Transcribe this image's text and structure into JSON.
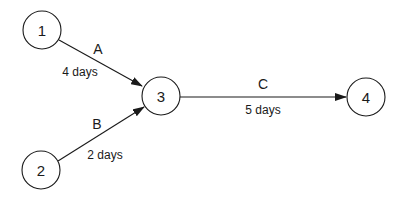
{
  "diagram": {
    "type": "activity-on-arrow network",
    "nodes": [
      {
        "id": "1",
        "label": "1",
        "cx": 42,
        "cy": 30,
        "r": 19
      },
      {
        "id": "2",
        "label": "2",
        "cx": 41,
        "cy": 170,
        "r": 19
      },
      {
        "id": "3",
        "label": "3",
        "cx": 161,
        "cy": 96,
        "r": 19
      },
      {
        "id": "4",
        "label": "4",
        "cx": 366,
        "cy": 97,
        "r": 19
      }
    ],
    "edges": [
      {
        "id": "A",
        "from": "1",
        "to": "3",
        "name": "A",
        "duration": "4 days",
        "x1": 59,
        "y1": 40,
        "x2": 142,
        "y2": 86,
        "name_x": 98,
        "name_y": 49,
        "duration_x": 80,
        "duration_y": 72
      },
      {
        "id": "B",
        "from": "2",
        "to": "3",
        "name": "B",
        "duration": "2 days",
        "x1": 58,
        "y1": 161,
        "x2": 144,
        "y2": 107,
        "name_x": 97,
        "name_y": 124,
        "duration_x": 105,
        "duration_y": 155
      },
      {
        "id": "C",
        "from": "3",
        "to": "4",
        "name": "C",
        "duration": "5 days",
        "x1": 180,
        "y1": 97,
        "x2": 346,
        "y2": 97,
        "name_x": 263,
        "name_y": 84,
        "duration_x": 263,
        "duration_y": 110
      }
    ]
  }
}
